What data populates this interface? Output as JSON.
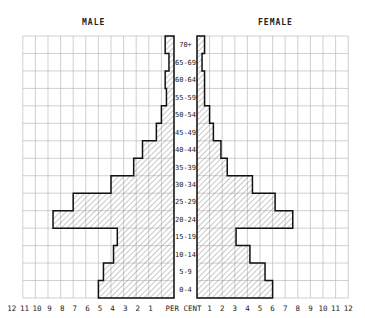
{
  "chart_data": {
    "type": "bar",
    "subtype": "population-pyramid",
    "title": "",
    "left_label": "MALE",
    "right_label": "FEMALE",
    "xlabel": "PER CENT",
    "ylabel": "",
    "categories": [
      "70+",
      "65-69",
      "60-64",
      "55-59",
      "50-54",
      "45-49",
      "40-44",
      "35-39",
      "30-34",
      "25-29",
      "20-24",
      "15-19",
      "10-14",
      "5-9",
      "0-4"
    ],
    "series": [
      {
        "name": "MALE",
        "values": [
          0.7,
          0.4,
          0.7,
          0.6,
          1.0,
          1.4,
          2.5,
          3.2,
          5.0,
          8.0,
          9.6,
          4.5,
          4.8,
          5.6,
          6.0
        ]
      },
      {
        "name": "FEMALE",
        "values": [
          0.6,
          0.4,
          0.6,
          0.6,
          1.0,
          1.3,
          1.9,
          2.4,
          4.4,
          6.2,
          7.6,
          3.1,
          4.2,
          5.4,
          6.0
        ]
      }
    ],
    "xlim": [
      0,
      12
    ],
    "x_ticks": [
      12,
      11,
      10,
      9,
      8,
      7,
      6,
      5,
      4,
      3,
      2,
      1,
      "PER CENT",
      1,
      2,
      3,
      4,
      5,
      6,
      7,
      8,
      9,
      10,
      11,
      12
    ],
    "grid": true,
    "hatched_bars": true
  }
}
